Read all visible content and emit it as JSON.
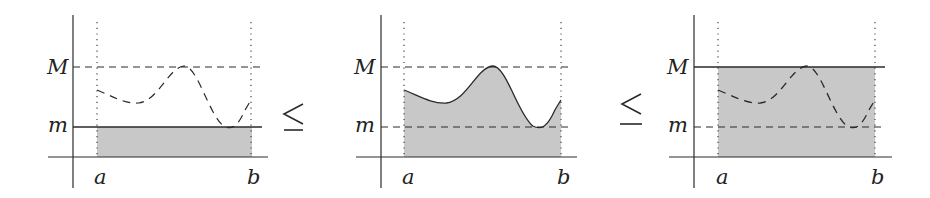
{
  "figure": {
    "colors": {
      "fill": "#c8c8c8",
      "ink": "#2a2a2a"
    },
    "relation_symbol": "≤",
    "panels": [
      {
        "id": "lower-bound",
        "labels": {
          "M": "M",
          "m": "m",
          "a": "a",
          "b": "b"
        },
        "shaded_region": "rectangle from x-axis to m",
        "curve_style": "dashed",
        "m_line": "solid",
        "M_line": "dashed"
      },
      {
        "id": "integral",
        "labels": {
          "M": "M",
          "m": "m",
          "a": "a",
          "b": "b"
        },
        "shaded_region": "area under curve",
        "curve_style": "solid",
        "m_line": "dashed",
        "M_line": "dashed"
      },
      {
        "id": "upper-bound",
        "labels": {
          "M": "M",
          "m": "m",
          "a": "a",
          "b": "b"
        },
        "shaded_region": "rectangle from x-axis to M",
        "curve_style": "dashed",
        "m_line": "dashed",
        "M_line": "solid"
      }
    ]
  }
}
